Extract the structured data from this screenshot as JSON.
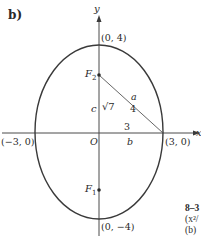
{
  "panel_label": "b)",
  "axes": {
    "x_label": "x",
    "y_label": "y",
    "origin_label": "O"
  },
  "points": {
    "top_vertex": "(0, 4)",
    "bottom_vertex": "(0, −4)",
    "left_vertex": "(−3, 0)",
    "right_vertex": "(3, 0)"
  },
  "foci": {
    "upper": "F",
    "upper_sub": "2",
    "lower": "F",
    "lower_sub": "1"
  },
  "segments": {
    "c_label": "c",
    "c_value": "√7",
    "a_label": "a",
    "a_value": "4",
    "b_label": "b",
    "b_value": "3"
  },
  "caption_fragment": {
    "line1": "8–3",
    "line2": "(x²/",
    "line3": "(b) "
  },
  "colors": {
    "stroke": "#4a4a4a",
    "ellipse": "#3a3a3a",
    "text": "#2a2a2a"
  }
}
